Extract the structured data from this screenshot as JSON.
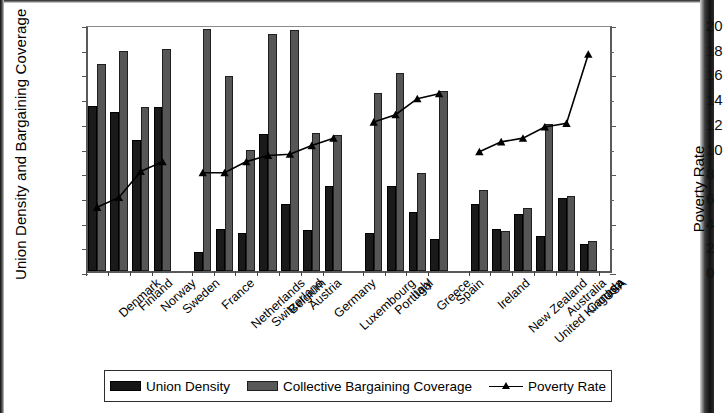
{
  "chart_data": {
    "type": "bar",
    "title": "",
    "ylabel": "Union Density and Bargaining Coverage",
    "ylabel_secondary": "Poverty Rate",
    "xlabel": "",
    "ylim": [
      0,
      100
    ],
    "ylim_secondary": [
      0,
      20
    ],
    "yticks": [
      0,
      10,
      20,
      30,
      40,
      50,
      60,
      70,
      80,
      90,
      100
    ],
    "yticks_secondary": [
      0,
      2,
      4,
      6,
      8,
      10,
      12,
      14,
      16,
      18,
      20
    ],
    "grid": false,
    "legend_position": "bottom",
    "categories": [
      "Denmark",
      "Finland",
      "Norway",
      "Sweden",
      "France",
      "Netherlands",
      "Switzerland",
      "Belgium",
      "Austria",
      "Germany",
      "Luxembourg",
      "Portugal",
      "Italy",
      "Greece",
      "Spain",
      "Ireland",
      "New Zealand",
      "United Kingdom",
      "Australia",
      "Canada",
      "USA"
    ],
    "groups": [
      {
        "name": "Nordic",
        "members": [
          "Denmark",
          "Finland",
          "Norway",
          "Sweden"
        ]
      },
      {
        "name": "Continental",
        "members": [
          "France",
          "Netherlands",
          "Switzerland",
          "Belgium",
          "Austria",
          "Germany",
          "Luxembourg"
        ]
      },
      {
        "name": "Southern",
        "members": [
          "Portugal",
          "Italy",
          "Greece",
          "Spain"
        ]
      },
      {
        "name": "Anglo",
        "members": [
          "Ireland",
          "New Zealand",
          "United Kingdom",
          "Australia",
          "Canada",
          "USA"
        ]
      }
    ],
    "series": [
      {
        "name": "Union Density",
        "axis": "left",
        "color": "#1a1a1a",
        "values": [
          67,
          64.5,
          53,
          66.5,
          7.5,
          17,
          15.5,
          55.5,
          27,
          16.5,
          34.5,
          15.5,
          34.5,
          24,
          13,
          27,
          17,
          23,
          14,
          29.5,
          11
        ]
      },
      {
        "name": "Collective Bargaining Coverage",
        "axis": "left",
        "color": "#565656",
        "values": [
          84,
          89,
          66.5,
          90,
          98,
          79,
          49,
          96,
          97.5,
          56,
          55,
          72,
          80,
          39.5,
          73,
          33,
          16,
          25.5,
          59.5,
          30.5,
          12
        ]
      },
      {
        "name": "Poverty Rate",
        "axis": "right",
        "color": "#000000",
        "marker": "triangle",
        "values": [
          5.4,
          6.2,
          8.3,
          9.1,
          8.2,
          8.2,
          9.1,
          9.6,
          9.7,
          10.4,
          11.0,
          12.3,
          12.9,
          14.2,
          14.6,
          9.9,
          10.7,
          11.0,
          11.9,
          12.2,
          17.8
        ]
      }
    ]
  },
  "legend": {
    "items": [
      {
        "label": "Union Density",
        "marker": "bar-dark"
      },
      {
        "label": "Collective Bargaining Coverage",
        "marker": "bar-gray"
      },
      {
        "label": "Poverty Rate",
        "marker": "line-triangle"
      }
    ]
  },
  "axes": {
    "left_title": "Union Density and Bargaining Coverage",
    "right_title": "Poverty Rate"
  }
}
